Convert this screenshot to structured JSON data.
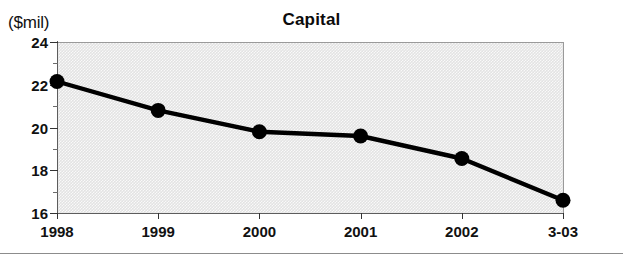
{
  "figure": {
    "unit_label": "($mil)",
    "title": "Capital"
  },
  "chart_data": {
    "type": "line",
    "title": "Capital",
    "subtitle": "",
    "xlabel": "",
    "ylabel": "($mil)",
    "unit": "$mil",
    "categories": [
      "1998",
      "1999",
      "2000",
      "2001",
      "2002",
      "3-03"
    ],
    "values": [
      22.15,
      20.8,
      19.8,
      19.6,
      18.55,
      16.6
    ],
    "series": [
      {
        "name": "Capital",
        "values": [
          22.15,
          20.8,
          19.8,
          19.6,
          18.55,
          16.6
        ]
      }
    ],
    "ylim": [
      16,
      24
    ],
    "ytick_labels": [
      "16",
      "18",
      "20",
      "22",
      "24"
    ],
    "ytick_values": [
      16,
      18,
      20,
      22,
      24
    ],
    "yminor_values": [
      17,
      19,
      21,
      23
    ],
    "xtick_labels": [
      "1998",
      "1999",
      "2000",
      "2001",
      "2002",
      "3-03"
    ],
    "grid": false,
    "legend": false,
    "legend_position": "none",
    "marker": "filled-circle",
    "line_color": "#000000",
    "marker_color": "#000000",
    "plot_background": "#e3e3e3",
    "annotations": []
  }
}
